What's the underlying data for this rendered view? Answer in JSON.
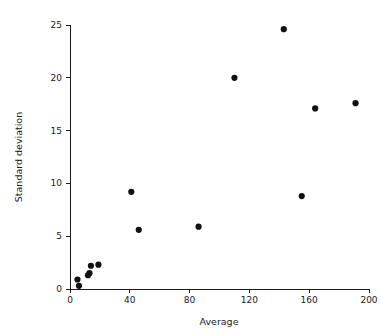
{
  "chart_data": {
    "type": "scatter",
    "title": "",
    "xlabel": "Average",
    "ylabel": "Standard deviation",
    "xlim": [
      0,
      200
    ],
    "ylim": [
      0,
      25
    ],
    "xticks": [
      0,
      40,
      80,
      120,
      160,
      200
    ],
    "yticks": [
      0,
      5,
      10,
      15,
      20,
      25
    ],
    "xtick_labels": [
      "0",
      "40",
      "80",
      "120",
      "160",
      "200"
    ],
    "ytick_labels": [
      "0",
      "5",
      "10",
      "15",
      "20",
      "25"
    ],
    "grid": false,
    "legend": null,
    "marker": {
      "shape": "circle",
      "color": "#111111",
      "size_px": 3.1
    },
    "series": [
      {
        "name": "measurements",
        "points": [
          {
            "x": 5,
            "y": 0.9
          },
          {
            "x": 6,
            "y": 0.3
          },
          {
            "x": 12,
            "y": 1.3
          },
          {
            "x": 13,
            "y": 1.5
          },
          {
            "x": 14,
            "y": 2.2
          },
          {
            "x": 19,
            "y": 2.3
          },
          {
            "x": 41,
            "y": 9.2
          },
          {
            "x": 46,
            "y": 5.6
          },
          {
            "x": 86,
            "y": 5.9
          },
          {
            "x": 110,
            "y": 20.0
          },
          {
            "x": 143,
            "y": 24.6
          },
          {
            "x": 155,
            "y": 8.8
          },
          {
            "x": 164,
            "y": 17.1
          },
          {
            "x": 191,
            "y": 17.6
          }
        ]
      }
    ]
  },
  "colors": {
    "axis": "#1a1a1a",
    "marker": "#111111",
    "background": "#ffffff"
  }
}
